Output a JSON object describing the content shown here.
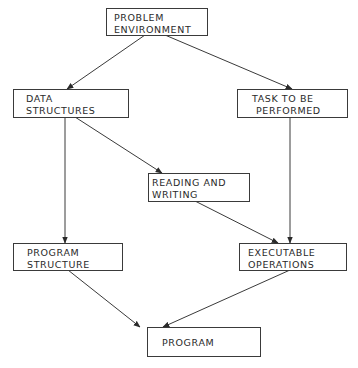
{
  "diagram": {
    "type": "flowchart",
    "nodes": [
      {
        "id": "problem_environment",
        "lines": [
          "PROBLEM",
          "ENVIRONMENT"
        ]
      },
      {
        "id": "data_structures",
        "lines": [
          "DATA",
          "STRUCTURES"
        ]
      },
      {
        "id": "task_to_be_performed",
        "lines": [
          "TASK TO BE",
          "PERFORMED"
        ]
      },
      {
        "id": "reading_and_writing",
        "lines": [
          "READING AND",
          "WRITING"
        ]
      },
      {
        "id": "program_structure",
        "lines": [
          "PROGRAM",
          "STRUCTURE"
        ]
      },
      {
        "id": "executable_operations",
        "lines": [
          "EXECUTABLE",
          "OPERATIONS"
        ]
      },
      {
        "id": "program",
        "lines": [
          "PROGRAM"
        ]
      }
    ],
    "edges": [
      {
        "from": "problem_environment",
        "to": "data_structures"
      },
      {
        "from": "problem_environment",
        "to": "task_to_be_performed"
      },
      {
        "from": "data_structures",
        "to": "reading_and_writing"
      },
      {
        "from": "data_structures",
        "to": "program_structure"
      },
      {
        "from": "task_to_be_performed",
        "to": "executable_operations"
      },
      {
        "from": "reading_and_writing",
        "to": "executable_operations"
      },
      {
        "from": "program_structure",
        "to": "program"
      },
      {
        "from": "executable_operations",
        "to": "program"
      }
    ],
    "colors": {
      "stroke": "#3a3a3a",
      "text": "#2a2a2a",
      "background": "#ffffff"
    }
  }
}
